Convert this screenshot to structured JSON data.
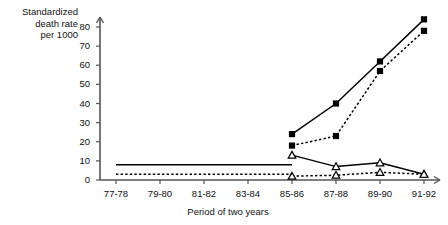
{
  "axes": {
    "ylabel_lines": [
      "Standardized",
      "death rate",
      "per 1000"
    ],
    "xlabel": "Period of two years",
    "yticks": [
      "0",
      "10",
      "20",
      "30",
      "40",
      "50",
      "60",
      "70",
      "80"
    ],
    "xticks": [
      "77-78",
      "79-80",
      "81-82",
      "83-84",
      "85-86",
      "87-88",
      "89-90",
      "91-92"
    ]
  },
  "colors": {
    "ink": "#000000",
    "axis": "#555555"
  },
  "chart_data": {
    "type": "line",
    "title": "",
    "xlabel": "Period of two years",
    "ylabel": "Standardized death rate per 1000",
    "categories": [
      "77-78",
      "79-80",
      "81-82",
      "83-84",
      "85-86",
      "87-88",
      "89-90",
      "91-92"
    ],
    "ylim": [
      0,
      85
    ],
    "yticks": [
      0,
      10,
      20,
      30,
      40,
      50,
      60,
      70,
      80
    ],
    "grid": false,
    "legend": "none",
    "series": [
      {
        "name": "solid-square-series",
        "marker": "square",
        "line": "solid",
        "x": [
          "85-86",
          "87-88",
          "89-90",
          "91-92"
        ],
        "values": [
          24,
          40,
          62,
          84
        ]
      },
      {
        "name": "dashed-square-series",
        "marker": "square",
        "line": "dashed",
        "x": [
          "85-86",
          "87-88",
          "89-90",
          "91-92"
        ],
        "values": [
          18,
          23,
          57,
          78
        ]
      },
      {
        "name": "solid-triangle-series",
        "marker": "triangle",
        "line": "solid",
        "x": [
          "85-86",
          "87-88",
          "89-90",
          "91-92"
        ],
        "values": [
          13,
          7,
          9,
          3
        ]
      },
      {
        "name": "dashed-triangle-series",
        "marker": "triangle",
        "line": "dashed",
        "x": [
          "85-86",
          "87-88",
          "89-90",
          "91-92"
        ],
        "values": [
          2,
          2.5,
          4,
          3
        ]
      },
      {
        "name": "baseline-solid-line",
        "marker": "none",
        "line": "solid",
        "x": [
          "77-78",
          "85-86"
        ],
        "values": [
          8,
          8
        ]
      },
      {
        "name": "baseline-dashed-line",
        "marker": "none",
        "line": "dashed",
        "x": [
          "77-78",
          "85-86"
        ],
        "values": [
          3,
          3
        ]
      }
    ]
  }
}
